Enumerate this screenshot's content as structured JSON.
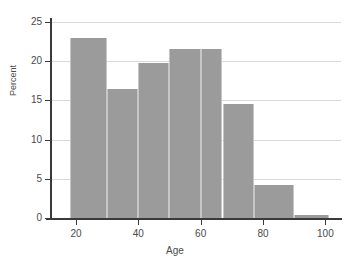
{
  "chart_data": {
    "type": "bar",
    "title": "",
    "subtitle": "",
    "xlabel": "Age",
    "ylabel": "Percent",
    "xlim": [
      12,
      105
    ],
    "ylim": [
      0,
      25
    ],
    "grid": "horizontal",
    "legend": "none",
    "bar_color": "#9b9b9b",
    "bar_edge_color": "#c6c6c6",
    "gridline_color": "#d9d9d9",
    "axis_color": "#3a3a3a",
    "background_color": "#ffffff",
    "xticks": [
      20,
      40,
      60,
      80,
      100
    ],
    "xtick_labels": [
      "20",
      "40",
      "60",
      "80",
      "100"
    ],
    "yticks": [
      0,
      5,
      10,
      15,
      20,
      25
    ],
    "ytick_labels": [
      "0",
      "5",
      "10",
      "15",
      "20",
      "25"
    ],
    "bin_edges": [
      18,
      30,
      40,
      50,
      60,
      67,
      77,
      90,
      101
    ],
    "categories": [
      "18-30",
      "30-40",
      "40-50",
      "50-60",
      "60-67",
      "67-77",
      "77-90",
      "90-101"
    ],
    "values": [
      23.0,
      16.5,
      19.8,
      21.5,
      21.5,
      14.5,
      4.2,
      0.4
    ],
    "bars": [
      {
        "label": "18-30",
        "start": 18,
        "end": 30,
        "value": 23.0
      },
      {
        "label": "30-40",
        "start": 30,
        "end": 40,
        "value": 16.5
      },
      {
        "label": "40-50",
        "start": 40,
        "end": 50,
        "value": 19.8
      },
      {
        "label": "50-60",
        "start": 50,
        "end": 60,
        "value": 21.5
      },
      {
        "label": "60-67",
        "start": 60,
        "end": 67,
        "value": 21.5
      },
      {
        "label": "67-77",
        "start": 67,
        "end": 77,
        "value": 14.5
      },
      {
        "label": "77-90",
        "start": 77,
        "end": 90,
        "value": 4.2
      },
      {
        "label": "90-101",
        "start": 90,
        "end": 101,
        "value": 0.4
      }
    ]
  }
}
